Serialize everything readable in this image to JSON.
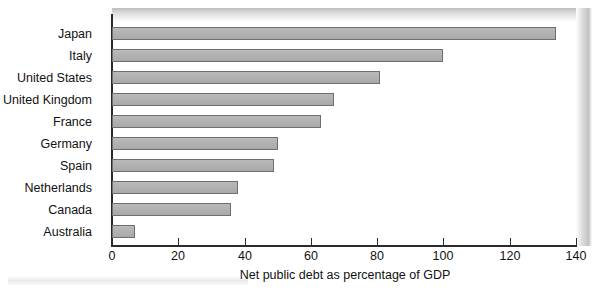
{
  "chart_data": {
    "type": "bar",
    "orientation": "horizontal",
    "title": "",
    "xlabel": "Net public debt as percentage of GDP",
    "ylabel": "",
    "xlim": [
      0,
      140
    ],
    "xticks": [
      0,
      20,
      40,
      60,
      80,
      100,
      120,
      140
    ],
    "xtick_labels": [
      "0",
      "20",
      "40",
      "60",
      "80",
      "100",
      "120",
      "140"
    ],
    "grid": false,
    "legend": false,
    "categories": [
      "Japan",
      "Italy",
      "United States",
      "United Kingdom",
      "France",
      "Germany",
      "Spain",
      "Netherlands",
      "Canada",
      "Australia"
    ],
    "values": [
      134,
      100,
      81,
      67,
      63,
      50,
      49,
      38,
      36,
      7
    ],
    "bar_color": "#b2b2b2",
    "bar_edge_color": "#6f6f6f",
    "axis_color": "#2b2b2b",
    "text_color": "#111111",
    "background": "#ffffff"
  }
}
